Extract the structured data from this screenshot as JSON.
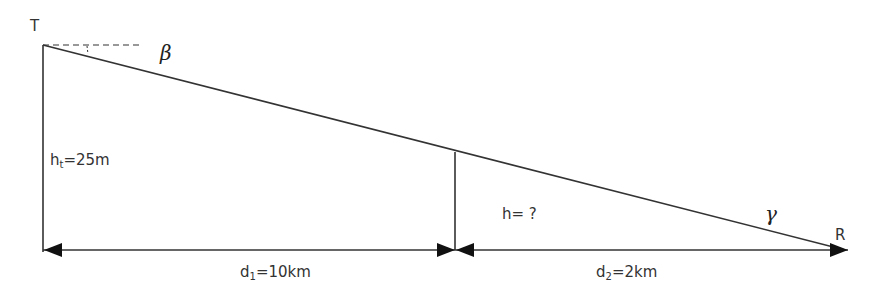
{
  "diagram": {
    "points": {
      "transmitter": {
        "label": "T"
      },
      "receiver": {
        "label": "R"
      }
    },
    "angles": {
      "beta": {
        "symbol": "β"
      },
      "gamma": {
        "symbol": "γ"
      }
    },
    "labels": {
      "ht": {
        "main": "h",
        "sub": "t",
        "rest": "=25m"
      },
      "h": {
        "text": "h= ?"
      },
      "d1": {
        "main": "d",
        "sub": "1",
        "rest": "=10km"
      },
      "d2": {
        "main": "d",
        "sub": "2",
        "rest": "=2km"
      }
    },
    "values": {
      "transmitter_height_m": 25,
      "d1_km": 10,
      "d2_km": 2,
      "h": "?"
    },
    "colors": {
      "line": "#333333",
      "text": "#333333"
    }
  }
}
